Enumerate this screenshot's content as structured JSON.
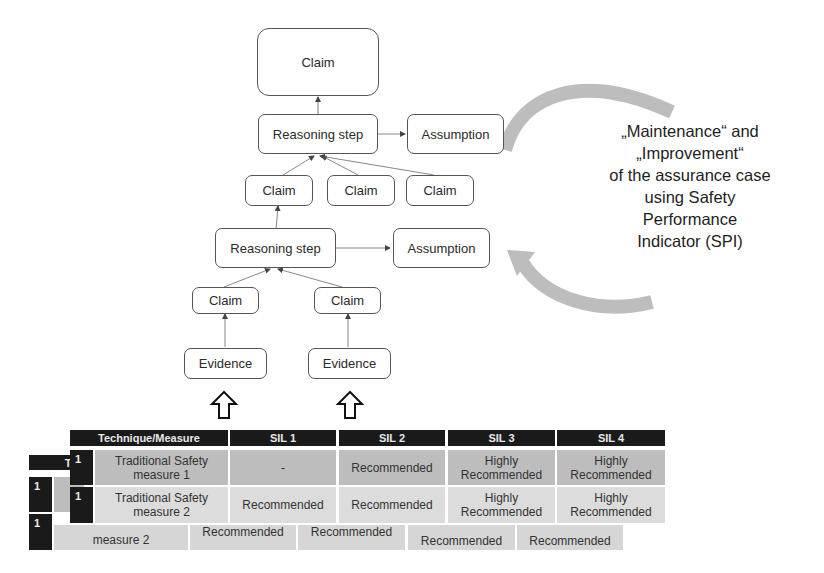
{
  "diagram": {
    "nodes": {
      "top_claim": "Claim",
      "reasoning_step_1": "Reasoning step",
      "assumption_1": "Assumption",
      "claim_a": "Claim",
      "claim_b": "Claim",
      "claim_c": "Claim",
      "reasoning_step_2": "Reasoning step",
      "assumption_2": "Assumption",
      "claim_left": "Claim",
      "claim_right": "Claim",
      "evidence_left": "Evidence",
      "evidence_right": "Evidence"
    },
    "cycle_label": {
      "line1": "„Maintenance“ and",
      "line2": "„Improvement“",
      "line3": "of the assurance case",
      "line4": "using Safety",
      "line5": "Performance",
      "line6": "Indicator (SPI)"
    },
    "colors": {
      "cycle_arrow": "#b8b8b8",
      "table_header": "#1a1a1a",
      "row1_bg": "#bdbdbd",
      "row2_bg": "#dcdcdc"
    }
  },
  "table_front": {
    "headers": [
      "Technique/Measure",
      "SIL 1",
      "SIL 2",
      "SIL 3",
      "SIL 4"
    ],
    "rows": [
      {
        "num": "1",
        "technique": "Traditional Safety measure 1",
        "sil1": "-",
        "sil2": "Recommended",
        "sil3": "Highly Recommended",
        "sil4": "Highly Recommended"
      },
      {
        "num": "1",
        "technique": "Traditional Safety measure 2",
        "sil1": "Recommended",
        "sil2": "Recommended",
        "sil3": "Highly Recommended",
        "sil4": "Highly Recommended"
      }
    ]
  },
  "table_back": {
    "header_partial": "Tec",
    "rows": [
      {
        "num": "1"
      },
      {
        "num": "1",
        "technique_partial": "measure 2",
        "sil1": "Recommended",
        "sil2": "Recommended",
        "sil3": "Recommended",
        "sil4": "Recommended"
      }
    ]
  }
}
